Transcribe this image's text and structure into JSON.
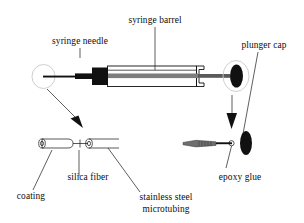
{
  "figure": {
    "background_color": "#ffffff",
    "ink_color": "#111111",
    "ghost_outline_color": "#c9c9c9",
    "shaft_gray": "#808080",
    "width": 304,
    "height": 223
  },
  "labels": {
    "syringe_needle": "syringe needle",
    "syringe_barrel": "syringe barrel",
    "plunger_cap": "plunger cap",
    "coating": "coating",
    "silica_fiber": "silica fiber",
    "stainless_steel_line1": "stainless steel",
    "stainless_steel_line2": "microtubing",
    "epoxy_glue": "epoxy glue"
  },
  "parts": [
    {
      "id": "syringe-needle",
      "label": "syringe needle",
      "group": "assembled-syringe"
    },
    {
      "id": "syringe-barrel",
      "label": "syringe barrel",
      "group": "assembled-syringe"
    },
    {
      "id": "plunger-cap",
      "label": "plunger cap",
      "group": "assembled-syringe"
    },
    {
      "id": "coating",
      "label": "coating",
      "group": "fiber-detail"
    },
    {
      "id": "silica-fiber",
      "label": "silica fiber",
      "group": "fiber-detail"
    },
    {
      "id": "stainless-steel-microtubing",
      "label": "stainless steel microtubing",
      "group": "fiber-detail"
    },
    {
      "id": "epoxy-glue",
      "label": "epoxy glue",
      "group": "plunger-detail"
    }
  ],
  "callouts": {
    "left_zoom_from": "needle tip",
    "left_zoom_to": "fiber and microtubing detail",
    "right_zoom_from": "plunger cap",
    "right_zoom_to": "plunger rod and epoxy glue detail"
  }
}
